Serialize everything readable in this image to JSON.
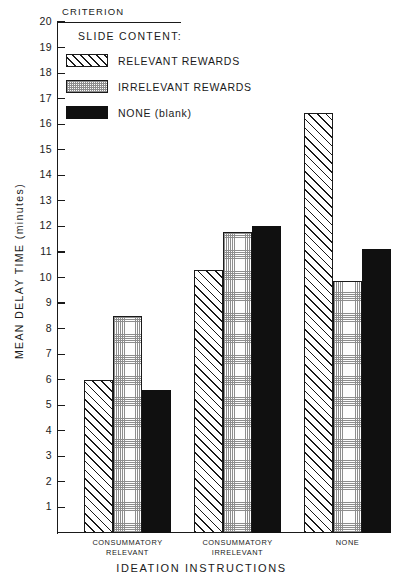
{
  "chart_data": {
    "type": "bar",
    "title": "",
    "xlabel": "IDEATION INSTRUCTIONS",
    "ylabel": "MEAN DELAY TIME (minutes)",
    "ylim": [
      0,
      20
    ],
    "ytick_labels": [
      "20",
      "19",
      "18",
      "17",
      "16",
      "15",
      "14",
      "13",
      "12",
      "11",
      "10",
      "9",
      "8",
      "7",
      "6",
      "5",
      "4",
      "3",
      "2",
      "1"
    ],
    "ytick_values": [
      20,
      19,
      18,
      17,
      16,
      15,
      14,
      13,
      12,
      11,
      10,
      9,
      8,
      7,
      6,
      5,
      4,
      3,
      2,
      1
    ],
    "grid": false,
    "legend_position": "upper-left-inside",
    "legend_title": "SLIDE CONTENT:",
    "annotations": [
      {
        "text": "CRITERION",
        "value": 20,
        "kind": "reference-line-label"
      }
    ],
    "categories": [
      "CONSUMMATORY\nRELEVANT",
      "CONSUMMATORY\nIRRELEVANT",
      "NONE"
    ],
    "category_lines": [
      [
        "CONSUMMATORY",
        "RELEVANT"
      ],
      [
        "CONSUMMATORY",
        "IRRELEVANT"
      ],
      [
        "NONE",
        ""
      ]
    ],
    "series": [
      {
        "name": "RELEVANT REWARDS",
        "pattern": "diagonal-hatch",
        "values": [
          6.0,
          10.3,
          16.45
        ]
      },
      {
        "name": "IRRELEVANT REWARDS",
        "pattern": "fine-grid",
        "values": [
          8.5,
          11.8,
          9.85
        ]
      },
      {
        "name": "NONE (blank)",
        "pattern": "solid-black",
        "values": [
          5.6,
          12.0,
          11.1
        ]
      }
    ]
  },
  "colors": {
    "ink": "#1a1a1a",
    "solid_fill": "#101010",
    "hatch_fill": "#ffffff",
    "grid_fill": "#fdfdfd",
    "background": "#ffffff"
  }
}
